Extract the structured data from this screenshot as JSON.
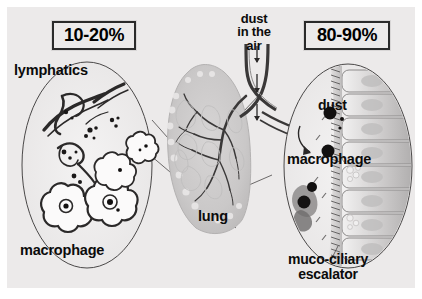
{
  "figure": {
    "background_color": "#eceaea",
    "frame_color": "#ffffff",
    "ink_color": "#0b0b0b"
  },
  "percent_boxes": {
    "left": {
      "value": "10-20%",
      "meaning": "fraction of inhaled dust reaching the alveolar region"
    },
    "right": {
      "value": "80-90%",
      "meaning": "fraction of inhaled dust cleared by the conducting airways"
    }
  },
  "labels": {
    "lymphatics": "lymphatics",
    "macrophage_left": "macrophage",
    "dust_in_the_air": "dust\nin the\nair",
    "dust_in_the_air_lines": [
      "dust",
      "in the",
      "air"
    ],
    "lung": "lung",
    "dust": "dust",
    "macrophage_right": "macrophage",
    "muco_ciliary_escalator": "muco-ciliary\nescalator",
    "muco_ciliary_escalator_lines": [
      "muco-ciliary",
      "escalator"
    ]
  },
  "panels": {
    "left_detail": {
      "name": "alveolar-region-detail",
      "contents": [
        "lymphatic vessels",
        "alveolar clusters",
        "dust-laden macrophages",
        "dust particles"
      ]
    },
    "center": {
      "name": "lung-cross-section",
      "contents": [
        "trachea",
        "bronchial tree",
        "lung parenchyma",
        "downward airflow arrows"
      ]
    },
    "right_detail": {
      "name": "airway-epithelium-detail",
      "contents": [
        "ciliated columnar epithelium",
        "mucus layer",
        "dust particles",
        "macrophage",
        "cilia"
      ]
    }
  },
  "icons": {
    "airflow_arrow": "down-arrow-icon",
    "macrophage_arrow": "curved-arrow-icon"
  }
}
